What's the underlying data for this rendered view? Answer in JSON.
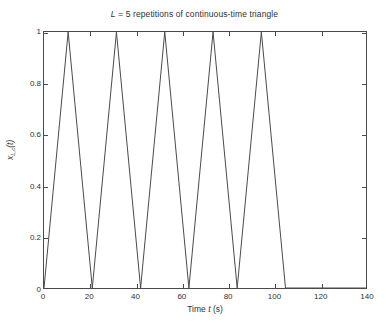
{
  "chart_data": {
    "type": "line",
    "title": "L = 5 repetitions of continuous-time triangle",
    "title_parts": {
      "variable": "L",
      "rest": " = 5 repetitions of continuous-time triangle"
    },
    "xlabel": "Time t (s)",
    "xlabel_parts": {
      "prefix": "Time ",
      "variable": "t",
      "suffix": " (s)"
    },
    "ylabel": "x_{L,c}(t)",
    "ylabel_parts": {
      "base": "x",
      "sub": "L,c",
      "arg": "(t)"
    },
    "xlim": [
      0,
      140
    ],
    "ylim": [
      0,
      1
    ],
    "xticks": [
      0,
      20,
      40,
      60,
      80,
      100,
      120,
      140
    ],
    "xticklabels": [
      "0",
      "20",
      "40",
      "60",
      "80",
      "100",
      "120",
      "140"
    ],
    "yticks": [
      0,
      0.2,
      0.4,
      0.6,
      0.8,
      1
    ],
    "yticklabels": [
      "0",
      "0.2",
      "0.4",
      "0.6",
      "0.8",
      "1"
    ],
    "grid": false,
    "legend": null,
    "line_color": "#4a4a4a",
    "line_width": 0.9,
    "repetitions": 5,
    "period": 21,
    "peak_offset": 10.5,
    "series": [
      {
        "name": "x_{L,c}(t)",
        "x": [
          0,
          10.5,
          21,
          31.5,
          42,
          52.5,
          63,
          73.5,
          84,
          94.5,
          105,
          140
        ],
        "y": [
          0,
          1,
          0,
          1,
          0,
          1,
          0,
          1,
          0,
          1,
          0,
          0
        ]
      }
    ],
    "peaks": [
      {
        "t": 10.5,
        "value": 1
      },
      {
        "t": 31.5,
        "value": 1
      },
      {
        "t": 52.5,
        "value": 1
      },
      {
        "t": 73.5,
        "value": 1
      },
      {
        "t": 94.5,
        "value": 1
      }
    ],
    "zero_crossings": [
      0,
      21,
      42,
      63,
      84,
      105
    ]
  }
}
